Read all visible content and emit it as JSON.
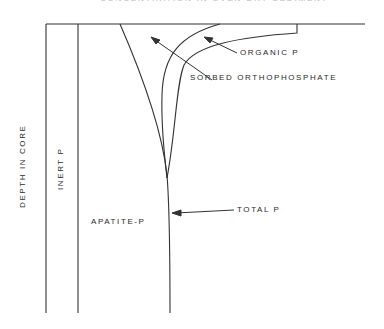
{
  "figure": {
    "title_partial": "CONCENTRATION IN OVEN-DRY SEDIMENT",
    "y_axis_label": "DEPTH IN CORE",
    "labels": {
      "organic": "ORGANIC P",
      "sorbed": "SORBED ORTHOPHOSPHATE",
      "total": "TOTAL P",
      "apatite": "APATITE-P",
      "inert": "INERT P"
    },
    "colors": {
      "line": "#333333",
      "text": "#2a2a2a"
    }
  }
}
